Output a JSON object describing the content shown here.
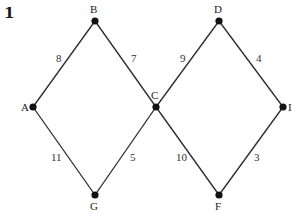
{
  "figure": {
    "number": "1",
    "nodes": [
      {
        "id": "A",
        "label": "A",
        "x": 33,
        "y": 107,
        "lx": 21,
        "ly": 111
      },
      {
        "id": "B",
        "label": "B",
        "x": 95,
        "y": 21,
        "lx": 90,
        "ly": 13
      },
      {
        "id": "C",
        "label": "C",
        "x": 156,
        "y": 107,
        "lx": 151,
        "ly": 99
      },
      {
        "id": "D",
        "label": "D",
        "x": 219,
        "y": 21,
        "lx": 214,
        "ly": 13
      },
      {
        "id": "I",
        "label": "I",
        "x": 283,
        "y": 107,
        "lx": 288,
        "ly": 111
      },
      {
        "id": "G",
        "label": "G",
        "x": 95,
        "y": 195,
        "lx": 90,
        "ly": 210
      },
      {
        "id": "F",
        "label": "F",
        "x": 219,
        "y": 195,
        "lx": 215,
        "ly": 210
      }
    ],
    "edges": [
      {
        "from": "A",
        "to": "B",
        "weight": "8",
        "lx": 56,
        "ly": 62
      },
      {
        "from": "B",
        "to": "C",
        "weight": "7",
        "lx": 131,
        "ly": 62
      },
      {
        "from": "C",
        "to": "D",
        "weight": "9",
        "lx": 180,
        "ly": 62
      },
      {
        "from": "D",
        "to": "I",
        "weight": "4",
        "lx": 256,
        "ly": 62
      },
      {
        "from": "A",
        "to": "G",
        "weight": "11",
        "lx": 51,
        "ly": 161
      },
      {
        "from": "G",
        "to": "C",
        "weight": "5",
        "lx": 130,
        "ly": 161
      },
      {
        "from": "C",
        "to": "F",
        "weight": "10",
        "lx": 176,
        "ly": 161
      },
      {
        "from": "F",
        "to": "I",
        "weight": "3",
        "lx": 254,
        "ly": 161
      }
    ]
  }
}
